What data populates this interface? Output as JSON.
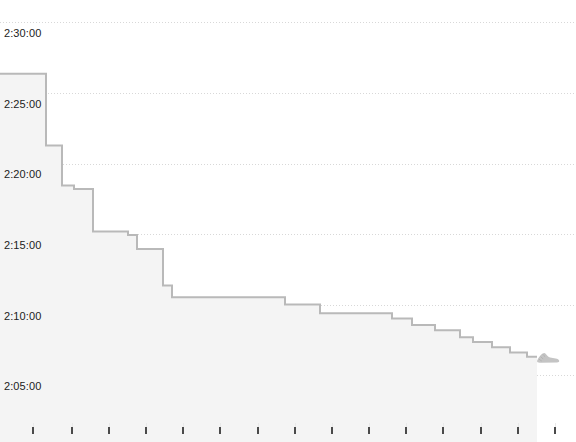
{
  "chart_data": {
    "type": "line",
    "line_style": "step-after",
    "title": "",
    "subtitle": "",
    "xlabel": "",
    "ylabel": "",
    "grid": true,
    "legend": false,
    "legend_position": "none",
    "y_tick_labels": [
      "2:30:00",
      "2:25:00",
      "2:20:00",
      "2:15:00",
      "2:10:00",
      "2:05:00"
    ],
    "y_tick_values_seconds": [
      9000,
      8700,
      8400,
      8100,
      7800,
      7500
    ],
    "y_tick_pixel_y": [
      22,
      93,
      164,
      234,
      305,
      375
    ],
    "ylim_seconds": [
      7420,
      9075
    ],
    "x_tick_count": 15,
    "x_tick_pixel_x": [
      33,
      72,
      109,
      146,
      183,
      220,
      258,
      295,
      332,
      369,
      406,
      443,
      481,
      518,
      555
    ],
    "x_axis_labels": [],
    "series_name": "",
    "series_color": "#b9b9b9",
    "fill_color": "#f4f4f4",
    "end_marker": "running-shoe-icon",
    "points": [
      {
        "x": 0,
        "y": 8780
      },
      {
        "x": 46,
        "y": 8780
      },
      {
        "x": 46,
        "y": 8475
      },
      {
        "x": 62,
        "y": 8475
      },
      {
        "x": 62,
        "y": 8305
      },
      {
        "x": 74,
        "y": 8305
      },
      {
        "x": 74,
        "y": 8290
      },
      {
        "x": 93,
        "y": 8290
      },
      {
        "x": 93,
        "y": 8110
      },
      {
        "x": 128,
        "y": 8110
      },
      {
        "x": 128,
        "y": 8095
      },
      {
        "x": 137,
        "y": 8095
      },
      {
        "x": 137,
        "y": 8035
      },
      {
        "x": 163,
        "y": 8035
      },
      {
        "x": 163,
        "y": 7880
      },
      {
        "x": 172,
        "y": 7880
      },
      {
        "x": 172,
        "y": 7830
      },
      {
        "x": 285,
        "y": 7830
      },
      {
        "x": 285,
        "y": 7800
      },
      {
        "x": 320,
        "y": 7800
      },
      {
        "x": 320,
        "y": 7762
      },
      {
        "x": 392,
        "y": 7762
      },
      {
        "x": 392,
        "y": 7740
      },
      {
        "x": 412,
        "y": 7740
      },
      {
        "x": 412,
        "y": 7712
      },
      {
        "x": 435,
        "y": 7712
      },
      {
        "x": 435,
        "y": 7690
      },
      {
        "x": 460,
        "y": 7690
      },
      {
        "x": 460,
        "y": 7660
      },
      {
        "x": 473,
        "y": 7660
      },
      {
        "x": 473,
        "y": 7640
      },
      {
        "x": 492,
        "y": 7640
      },
      {
        "x": 492,
        "y": 7618
      },
      {
        "x": 510,
        "y": 7618
      },
      {
        "x": 510,
        "y": 7596
      },
      {
        "x": 527,
        "y": 7596
      },
      {
        "x": 527,
        "y": 7578
      },
      {
        "x": 537,
        "y": 7578
      }
    ],
    "annotations": [
      {
        "name": "finish-shoe-marker",
        "x": 548,
        "y": 7578,
        "icon": "running-shoe-icon"
      }
    ]
  },
  "axes": {
    "y_labels": [
      {
        "text": "2:30:00",
        "top": 28
      },
      {
        "text": "2:25:00",
        "top": 99
      },
      {
        "text": "2:20:00",
        "top": 169
      },
      {
        "text": "2:15:00",
        "top": 240
      },
      {
        "text": "2:10:00",
        "top": 311
      },
      {
        "text": "2:05:00",
        "top": 381
      }
    ]
  },
  "colors": {
    "background": "#ffffff",
    "gridline": "#d8d8d8",
    "line": "#b9b9b9",
    "fill": "#f4f4f4",
    "tick": "#4a4a4a",
    "label_text": "#222222"
  }
}
